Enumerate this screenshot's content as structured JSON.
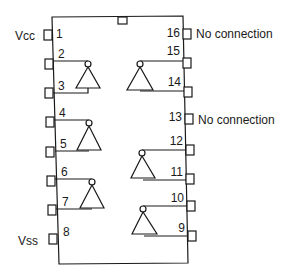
{
  "diagram": {
    "package_pins": 16,
    "left_pins": [
      {
        "number": "1",
        "label": "Vcc"
      },
      {
        "number": "2",
        "label": ""
      },
      {
        "number": "3",
        "label": ""
      },
      {
        "number": "4",
        "label": ""
      },
      {
        "number": "5",
        "label": ""
      },
      {
        "number": "6",
        "label": ""
      },
      {
        "number": "7",
        "label": ""
      },
      {
        "number": "8",
        "label": "Vss"
      }
    ],
    "right_pins": [
      {
        "number": "16",
        "label": "No connection"
      },
      {
        "number": "15",
        "label": ""
      },
      {
        "number": "14",
        "label": ""
      },
      {
        "number": "13",
        "label": "No connection"
      },
      {
        "number": "12",
        "label": ""
      },
      {
        "number": "11",
        "label": ""
      },
      {
        "number": "10",
        "label": ""
      },
      {
        "number": "9",
        "label": ""
      }
    ],
    "gates": [
      {
        "type": "inverter",
        "output_pin": "2",
        "input_pin": "3",
        "side": "left"
      },
      {
        "type": "inverter",
        "output_pin": "4",
        "input_pin": "5",
        "side": "left"
      },
      {
        "type": "inverter",
        "output_pin": "6",
        "input_pin": "7",
        "side": "left"
      },
      {
        "type": "inverter",
        "output_pin": "15",
        "input_pin": "14",
        "side": "right"
      },
      {
        "type": "inverter",
        "output_pin": "12",
        "input_pin": "11",
        "side": "right"
      },
      {
        "type": "inverter",
        "output_pin": "10",
        "input_pin": "9",
        "side": "right"
      }
    ],
    "labels": {
      "vcc": "Vcc",
      "vss": "Vss",
      "nc16": "No connection",
      "nc13": "No connection"
    },
    "colors": {
      "line": "#1a1a1a",
      "background": "#ffffff"
    }
  }
}
